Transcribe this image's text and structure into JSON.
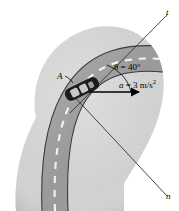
{
  "figure": {
    "name": "car-on-curved-road-normal-tangential-axes",
    "labels": {
      "tangential_axis": "t",
      "normal_axis": "n",
      "car_point": "A",
      "angle": "θ = 40°",
      "acceleration_symbol": "a",
      "acceleration_equals": " = 3 m/s",
      "acceleration_exponent": "2"
    },
    "values": {
      "angle_deg": 40,
      "acceleration_magnitude": 3,
      "acceleration_units": "m/s^2"
    },
    "colors": {
      "terrain_fill": "#d2d2d2",
      "terrain_stipple": "#b3b3b3",
      "road_fill": "#9a9a9a",
      "road_edge": "#3c3c3c",
      "lane_dash": "#f2f2f2",
      "car_body": "#1c1c1c",
      "car_window": "#c9c9c9",
      "line_stroke": "#333333",
      "background": "#ffffff"
    }
  }
}
